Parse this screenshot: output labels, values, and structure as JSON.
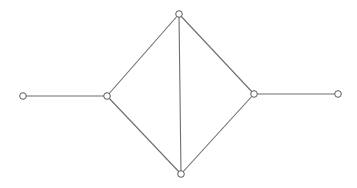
{
  "diagram": {
    "type": "graph",
    "colors": {
      "background": "#ffffff",
      "edge": "#6e6e6e",
      "node_stroke": "#5a5a5a",
      "node_fill": "#ffffff"
    },
    "node_radius": 3.3,
    "nodes": [
      {
        "id": "n1",
        "x": 23,
        "y": 96
      },
      {
        "id": "n2",
        "x": 107,
        "y": 96
      },
      {
        "id": "n3",
        "x": 179,
        "y": 14
      },
      {
        "id": "n4",
        "x": 181,
        "y": 174
      },
      {
        "id": "n5",
        "x": 254,
        "y": 94
      },
      {
        "id": "n6",
        "x": 338,
        "y": 94
      }
    ],
    "edges": [
      {
        "from": "n1",
        "to": "n2"
      },
      {
        "from": "n2",
        "to": "n3"
      },
      {
        "from": "n2",
        "to": "n4"
      },
      {
        "from": "n3",
        "to": "n4"
      },
      {
        "from": "n3",
        "to": "n5"
      },
      {
        "from": "n4",
        "to": "n5"
      },
      {
        "from": "n5",
        "to": "n6"
      }
    ]
  }
}
